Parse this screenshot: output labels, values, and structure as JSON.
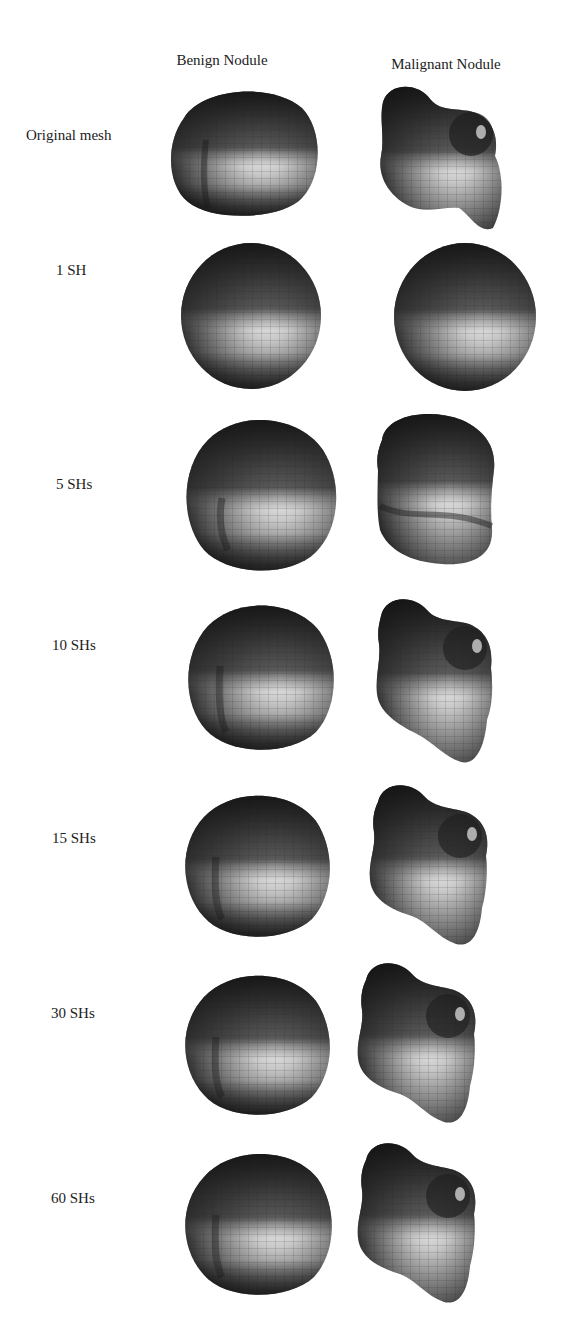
{
  "figure": {
    "columns": [
      {
        "label": "Benign Nodule",
        "x": 222,
        "y": 52
      },
      {
        "label": "Malignant Nodule",
        "x": 446,
        "y": 56
      }
    ],
    "rows": [
      {
        "label": "Original mesh",
        "label_x": 26,
        "label_y": 127,
        "benign_shape": "orig",
        "malignant_shape": "orig",
        "top": 80
      },
      {
        "label": "1 SH",
        "label_x": 56,
        "label_y": 262,
        "benign_shape": "sphere",
        "malignant_shape": "sphere",
        "top": 242
      },
      {
        "label": "5 SHs",
        "label_x": 56,
        "label_y": 476,
        "benign_shape": "5",
        "malignant_shape": "5",
        "top": 410
      },
      {
        "label": "10 SHs",
        "label_x": 52,
        "label_y": 637,
        "benign_shape": "10",
        "malignant_shape": "10",
        "top": 596
      },
      {
        "label": "15 SHs",
        "label_x": 52,
        "label_y": 830,
        "benign_shape": "15",
        "malignant_shape": "15",
        "top": 785
      },
      {
        "label": "30 SHs",
        "label_x": 51,
        "label_y": 1005,
        "benign_shape": "30",
        "malignant_shape": "30",
        "top": 960
      },
      {
        "label": "60 SHs",
        "label_x": 51,
        "label_y": 1190,
        "benign_shape": "60",
        "malignant_shape": "60",
        "top": 1141
      }
    ],
    "colors": {
      "surface_dark": "#1c1c1c",
      "surface_mid": "#5a5a5a",
      "surface_light": "#d8d8d8",
      "highlight": "#f2f2f2",
      "grid_line": "#2a2a2a",
      "text": "#222222",
      "background": "#ffffff"
    }
  }
}
